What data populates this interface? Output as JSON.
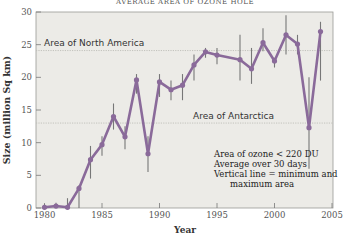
{
  "chart_data": {
    "type": "line",
    "title": "AVERAGE AREA OF OZONE HOLE",
    "xlabel": "Year",
    "ylabel": "Size (million Sq km)",
    "xlim": [
      1980,
      2005
    ],
    "ylim": [
      0,
      30
    ],
    "x_ticks": [
      1980,
      1985,
      1990,
      1995,
      2000,
      2005
    ],
    "y_ticks": [
      0,
      5,
      10,
      15,
      20,
      25,
      30
    ],
    "grid": false,
    "series": [
      {
        "name": "Average area of ozone hole",
        "color": "#8a6a9a",
        "x": [
          1980,
          1981,
          1982,
          1983,
          1984,
          1985,
          1986,
          1987,
          1988,
          1989,
          1990,
          1991,
          1992,
          1993,
          1994,
          1995,
          1997,
          1998,
          1999,
          2000,
          2001,
          2002,
          2003,
          2004
        ],
        "values": [
          0.1,
          0.3,
          0.1,
          3.0,
          7.4,
          9.7,
          14.0,
          10.9,
          19.6,
          8.3,
          19.3,
          18.1,
          18.8,
          21.9,
          23.9,
          23.4,
          22.7,
          21.3,
          25.3,
          22.5,
          26.5,
          25.1,
          12.3,
          27.0
        ],
        "min": [
          0.0,
          0.0,
          0.0,
          0.0,
          4.5,
          8.0,
          12.0,
          9.0,
          17.5,
          5.5,
          17.0,
          16.5,
          16.5,
          19.5,
          23.0,
          22.0,
          19.5,
          19.0,
          24.0,
          21.5,
          23.5,
          23.5,
          6.0,
          19.5
        ],
        "max": [
          0.6,
          0.8,
          1.5,
          3.5,
          9.5,
          11.0,
          16.0,
          12.5,
          20.5,
          11.0,
          20.5,
          19.5,
          20.5,
          23.5,
          24.5,
          24.5,
          26.5,
          24.5,
          27.5,
          23.0,
          29.5,
          26.5,
          20.0,
          28.5
        ]
      }
    ],
    "reference_lines": [
      {
        "label": "Area of North America",
        "value": 24.1
      },
      {
        "label": "Area of Antarctica",
        "value": 13.0
      }
    ],
    "annotations": [
      "Area of ozone < 220 DU",
      "Average over 30 days",
      "Vertical line = minimum and",
      "maximum area"
    ]
  },
  "labels": {
    "title": "AVERAGE AREA OF OZONE HOLE",
    "xlabel": "Year",
    "ylabel": "Size (million Sq km)",
    "ref_north_america": "Area of North America",
    "ref_antarctica": "Area of Antarctica",
    "note_1": "Area of ozone < 220 DU",
    "note_2": "Average over 30 days",
    "note_3": "Vertical line = minimum and",
    "note_4": "maximum area"
  },
  "colors": {
    "line": "#8a6a9a",
    "error_bar": "#777777",
    "plot_bg": "#ecebe7",
    "ref_line": "#bdbdb8"
  }
}
